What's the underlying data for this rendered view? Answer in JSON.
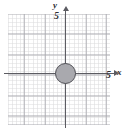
{
  "chart_data": {
    "type": "scatter",
    "title": "",
    "xlabel": "x",
    "ylabel": "y",
    "xlim": [
      -6.5,
      6.5
    ],
    "ylim": [
      -7,
      7
    ],
    "grid": true,
    "grid_major_step": 5,
    "grid_minor_step": 1,
    "legend": "none",
    "x_tick_labels": [
      "5"
    ],
    "y_tick_labels": [
      "5"
    ],
    "x_tick_values": [
      5
    ],
    "y_tick_values": [
      5
    ],
    "shapes": [
      {
        "kind": "circle",
        "center_x": 0,
        "center_y": 0,
        "radius": 5,
        "fill": "#a9a9ae",
        "stroke": "#4f4f55"
      }
    ],
    "annotations": []
  },
  "figure": {
    "axes": {
      "x_axis_name": "x-axis",
      "y_axis_name": "y-axis",
      "x_label": "x",
      "y_label": "y",
      "x_tick_label": "5",
      "y_tick_label": "5",
      "axis_color": "#5c5c62"
    },
    "grid": {
      "major_color": "#a8a8ae",
      "minor_color": "#afafb4"
    },
    "circle": {
      "fill_color": "#a9a9ae",
      "stroke_color": "#4f4f55"
    },
    "background_color": "#ffffff"
  }
}
